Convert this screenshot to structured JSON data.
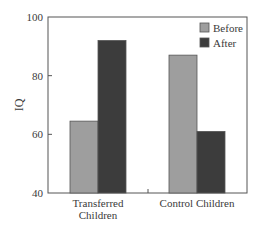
{
  "chart_data": {
    "type": "bar",
    "title": "",
    "xlabel": "",
    "ylabel": "IQ",
    "ylim": [
      40,
      100
    ],
    "yticks": [
      40,
      60,
      80,
      100
    ],
    "categories": [
      "Transferred Children",
      "Control Children"
    ],
    "category_lines": [
      [
        "Transferred",
        "Children"
      ],
      [
        "Control Children"
      ]
    ],
    "series": [
      {
        "name": "Before",
        "color": "#9e9e9e",
        "values": [
          64.5,
          87
        ]
      },
      {
        "name": "After",
        "color": "#3c3c3c",
        "values": [
          92,
          61
        ]
      }
    ],
    "legend": {
      "position": "top-right",
      "entries": [
        "Before",
        "After"
      ]
    },
    "grid": false
  }
}
